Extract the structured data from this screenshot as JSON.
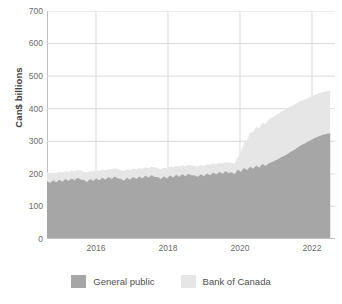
{
  "chart": {
    "type": "area",
    "ylabel": "Can$ billions",
    "xlabel": "",
    "title": ""
  },
  "axes": {
    "y_ticks": [
      "0",
      "100",
      "200",
      "300",
      "400",
      "500",
      "600",
      "700"
    ],
    "x_ticks": [
      "2016",
      "2018",
      "2020",
      "2022"
    ],
    "ylim_min": 0,
    "ylim_max": 700,
    "grid": "horizontal-and-vertical"
  },
  "legend": {
    "items": [
      {
        "label": "General public",
        "color": "#a6a6a6",
        "name": "general-public"
      },
      {
        "label": "Bank of Canada",
        "color": "#e6e6e6",
        "name": "bank-of-canada"
      }
    ]
  },
  "colors": {
    "general_public": "#a6a6a6",
    "bank_of_canada": "#e6e6e6",
    "grid": "#d9d9d9",
    "axis": "#bfbfbf",
    "text": "#6b6b6b"
  },
  "chart_data": {
    "type": "area",
    "stacked": true,
    "title": "",
    "xlabel": "",
    "ylabel": "Can$ billions",
    "ylim": [
      0,
      700
    ],
    "xlim": [
      2015.0,
      2022.8
    ],
    "grid": true,
    "legend_position": "bottom",
    "x": [
      2015.0,
      2015.08,
      2015.17,
      2015.25,
      2015.33,
      2015.42,
      2015.5,
      2015.58,
      2015.67,
      2015.75,
      2015.83,
      2015.92,
      2016.0,
      2016.08,
      2016.17,
      2016.25,
      2016.33,
      2016.42,
      2016.5,
      2016.58,
      2016.67,
      2016.75,
      2016.83,
      2016.92,
      2017.0,
      2017.08,
      2017.17,
      2017.25,
      2017.33,
      2017.42,
      2017.5,
      2017.58,
      2017.67,
      2017.75,
      2017.83,
      2017.92,
      2018.0,
      2018.08,
      2018.17,
      2018.25,
      2018.33,
      2018.42,
      2018.5,
      2018.58,
      2018.67,
      2018.75,
      2018.83,
      2018.92,
      2019.0,
      2019.08,
      2019.17,
      2019.25,
      2019.33,
      2019.42,
      2019.5,
      2019.58,
      2019.67,
      2019.75,
      2019.83,
      2019.92,
      2020.0,
      2020.08,
      2020.17,
      2020.25,
      2020.33,
      2020.42,
      2020.5,
      2020.58,
      2020.67,
      2020.75,
      2020.83,
      2020.92,
      2021.0,
      2021.08,
      2021.17,
      2021.25,
      2021.33,
      2021.42,
      2021.5,
      2021.58,
      2021.67,
      2021.75,
      2021.83,
      2021.92,
      2022.0,
      2022.08,
      2022.17,
      2022.25,
      2022.33,
      2022.42,
      2022.5,
      2022.58,
      2022.67
    ],
    "series": [
      {
        "name": "General public",
        "color": "#a6a6a6",
        "values": [
          178,
          172,
          180,
          174,
          182,
          176,
          184,
          178,
          186,
          180,
          188,
          182,
          181,
          175,
          184,
          178,
          186,
          180,
          188,
          182,
          190,
          184,
          192,
          186,
          185,
          179,
          188,
          182,
          190,
          184,
          192,
          186,
          194,
          188,
          196,
          190,
          190,
          184,
          192,
          186,
          195,
          189,
          197,
          191,
          199,
          193,
          200,
          195,
          196,
          190,
          199,
          193,
          201,
          196,
          204,
          198,
          206,
          200,
          208,
          203,
          205,
          199,
          213,
          206,
          218,
          212,
          222,
          216,
          226,
          219,
          230,
          224,
          232,
          236,
          240,
          245,
          250,
          255,
          260,
          266,
          272,
          278,
          284,
          290,
          294,
          300,
          305,
          310,
          314,
          318,
          321,
          323,
          325
        ]
      },
      {
        "name": "Bank of Canada",
        "color": "#e6e6e6",
        "values": [
          26,
          28,
          24,
          28,
          24,
          28,
          24,
          28,
          24,
          28,
          24,
          28,
          25,
          29,
          25,
          29,
          25,
          29,
          25,
          29,
          25,
          29,
          25,
          29,
          26,
          30,
          26,
          30,
          26,
          30,
          26,
          30,
          26,
          30,
          26,
          30,
          27,
          31,
          27,
          31,
          27,
          31,
          27,
          31,
          27,
          31,
          27,
          31,
          28,
          32,
          28,
          32,
          28,
          32,
          28,
          32,
          28,
          32,
          28,
          32,
          29,
          33,
          38,
          58,
          76,
          92,
          104,
          112,
          118,
          122,
          126,
          130,
          134,
          136,
          138,
          139,
          140,
          141,
          141,
          140,
          139,
          138,
          137,
          136,
          135,
          134,
          133,
          132,
          132,
          131,
          131,
          131,
          131
        ]
      }
    ],
    "totals_note": "Stacked total peaks near 456 Can$ billions at the right edge"
  }
}
